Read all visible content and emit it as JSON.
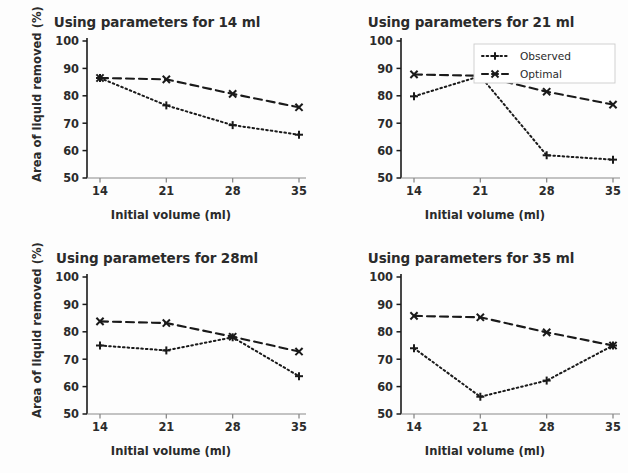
{
  "figure": {
    "background_color": "#fdfdfd",
    "line_color": "#1a1a1a",
    "text_color": "#2b2b2b"
  },
  "axis": {
    "xlabel": "Initial volume (ml)",
    "ylabel": "Area of liquid removed (%)",
    "xticks": [
      "14",
      "21",
      "28",
      "35"
    ],
    "yticks": [
      "50",
      "60",
      "70",
      "80",
      "90",
      "100"
    ]
  },
  "legend": {
    "position": "upper-right-panel-2",
    "entries": [
      {
        "label": "Observed",
        "marker": "plus",
        "linestyle": "dotted"
      },
      {
        "label": "Optimal",
        "marker": "x",
        "linestyle": "dashed"
      }
    ]
  },
  "chart_data": [
    {
      "type": "line",
      "panel": "top-left",
      "title": "Using parameters for 14 ml",
      "xlabel": "Initial volume (ml)",
      "ylabel": "Area of liquid removed (%)",
      "x": [
        14,
        21,
        28,
        35
      ],
      "xticklabels": [
        "14",
        "21",
        "28",
        "35"
      ],
      "ylim": [
        50,
        100
      ],
      "yticks": [
        50,
        60,
        70,
        80,
        90,
        100
      ],
      "grid": false,
      "series": [
        {
          "name": "Observed",
          "values": [
            86.5,
            76.5,
            69.3,
            65.8
          ],
          "marker": "plus",
          "linestyle": "dotted"
        },
        {
          "name": "Optimal",
          "values": [
            86.5,
            86.0,
            80.7,
            75.8
          ],
          "marker": "x",
          "linestyle": "dashed"
        }
      ]
    },
    {
      "type": "line",
      "panel": "top-right",
      "title": "Using parameters for 21 ml",
      "xlabel": "Initial volume (ml)",
      "ylabel": "",
      "x": [
        14,
        21,
        28,
        35
      ],
      "xticklabels": [
        "14",
        "21",
        "28",
        "35"
      ],
      "ylim": [
        50,
        100
      ],
      "yticks": [
        50,
        60,
        70,
        80,
        90,
        100
      ],
      "grid": false,
      "series": [
        {
          "name": "Observed",
          "values": [
            79.8,
            87.2,
            58.3,
            56.7
          ],
          "marker": "plus",
          "linestyle": "dotted"
        },
        {
          "name": "Optimal",
          "values": [
            87.8,
            87.3,
            81.5,
            76.8
          ],
          "marker": "x",
          "linestyle": "dashed"
        }
      ]
    },
    {
      "type": "line",
      "panel": "bottom-left",
      "title": "Using parameters for 28ml",
      "xlabel": "Initial volume (ml)",
      "ylabel": "Area of liquid removed (%)",
      "x": [
        14,
        21,
        28,
        35
      ],
      "xticklabels": [
        "14",
        "21",
        "28",
        "35"
      ],
      "ylim": [
        50,
        100
      ],
      "yticks": [
        50,
        60,
        70,
        80,
        90,
        100
      ],
      "grid": false,
      "series": [
        {
          "name": "Observed",
          "values": [
            75.0,
            73.2,
            78.0,
            63.8
          ],
          "marker": "plus",
          "linestyle": "dotted"
        },
        {
          "name": "Optimal",
          "values": [
            83.8,
            83.2,
            78.2,
            72.8
          ],
          "marker": "x",
          "linestyle": "dashed"
        }
      ]
    },
    {
      "type": "line",
      "panel": "bottom-right",
      "title": "Using parameters for 35 ml",
      "xlabel": "Initial volume (ml)",
      "ylabel": "",
      "x": [
        14,
        21,
        28,
        35
      ],
      "xticklabels": [
        "14",
        "21",
        "28",
        "35"
      ],
      "ylim": [
        50,
        100
      ],
      "yticks": [
        50,
        60,
        70,
        80,
        90,
        100
      ],
      "grid": false,
      "series": [
        {
          "name": "Observed",
          "values": [
            74.0,
            56.3,
            62.2,
            75.0
          ],
          "marker": "plus",
          "linestyle": "dotted"
        },
        {
          "name": "Optimal",
          "values": [
            85.8,
            85.3,
            79.8,
            75.0
          ],
          "marker": "x",
          "linestyle": "dashed"
        }
      ]
    }
  ]
}
